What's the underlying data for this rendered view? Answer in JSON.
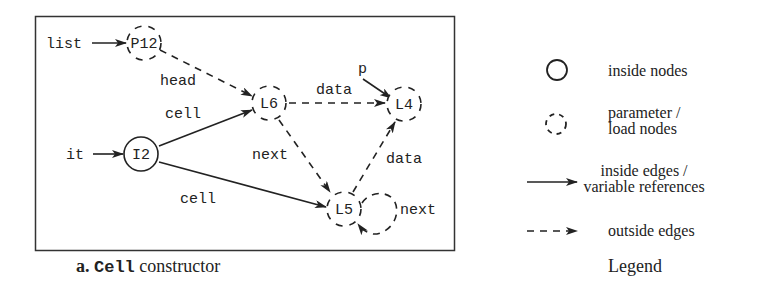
{
  "figure": {
    "caption": {
      "prefix": "a.",
      "code": "Cell",
      "suffix": "constructor"
    },
    "legend_title": "Legend"
  },
  "nodes": [
    {
      "id": "P12",
      "label": "P12",
      "kind": "parameter/load",
      "x": 144,
      "y": 43
    },
    {
      "id": "L6",
      "label": "L6",
      "kind": "parameter/load",
      "x": 269,
      "y": 103
    },
    {
      "id": "L4",
      "label": "L4",
      "kind": "parameter/load",
      "x": 404,
      "y": 104
    },
    {
      "id": "I2",
      "label": "I2",
      "kind": "inside",
      "x": 141,
      "y": 154
    },
    {
      "id": "L5",
      "label": "L5",
      "kind": "parameter/load",
      "x": 344,
      "y": 209
    }
  ],
  "variables": [
    {
      "name": "list",
      "target": "P12"
    },
    {
      "name": "it",
      "target": "I2"
    },
    {
      "name": "p",
      "target": "L4"
    }
  ],
  "edges": [
    {
      "from": "P12",
      "to": "L6",
      "label": "head",
      "style": "dashed"
    },
    {
      "from": "I2",
      "to": "L6",
      "label": "cell",
      "style": "solid"
    },
    {
      "from": "I2",
      "to": "L5",
      "label": "cell",
      "style": "solid"
    },
    {
      "from": "L6",
      "to": "L4",
      "label": "data",
      "style": "dashed"
    },
    {
      "from": "L6",
      "to": "L5",
      "label": "next",
      "style": "dashed"
    },
    {
      "from": "L5",
      "to": "L4",
      "label": "data",
      "style": "dashed"
    },
    {
      "from": "L5",
      "to": "L5",
      "label": "next",
      "style": "dashed"
    }
  ],
  "labels": {
    "var_list": "list",
    "var_it": "it",
    "var_p": "p",
    "node_P12": "P12",
    "node_L6": "L6",
    "node_L4": "L4",
    "node_I2": "I2",
    "node_L5": "L5",
    "edge_head": "head",
    "edge_cell_top": "cell",
    "edge_cell_bottom": "cell",
    "edge_data_top": "data",
    "edge_next": "next",
    "edge_data_right": "data",
    "edge_next_loop": "next"
  },
  "legend": {
    "items": [
      {
        "symbol": "solid-circle",
        "lines": [
          "inside nodes"
        ]
      },
      {
        "symbol": "dashed-circle",
        "lines": [
          "parameter /",
          "load nodes"
        ]
      },
      {
        "symbol": "solid-arrow",
        "lines": [
          "inside edges /",
          "variable references"
        ]
      },
      {
        "symbol": "dashed-arrow",
        "lines": [
          "outside edges"
        ]
      }
    ],
    "title": "Legend"
  },
  "colors": {
    "ink": "#222222",
    "background": "#ffffff"
  }
}
